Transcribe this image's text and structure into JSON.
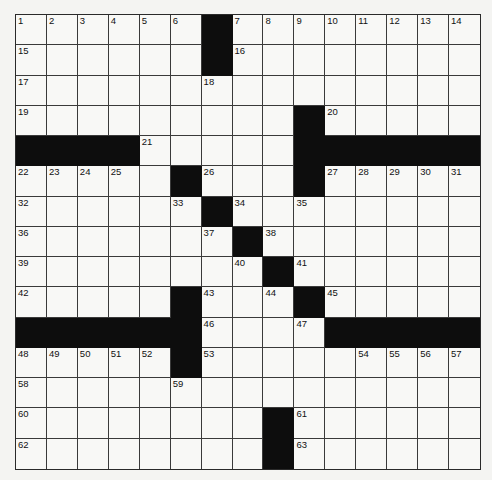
{
  "puzzle": {
    "rows": 15,
    "cols": 15,
    "colors": {
      "black": "#0d0d0d",
      "white": "#f8f8f6",
      "line": "#3a3a3a"
    },
    "layout": [
      "......#........",
      "......#........",
      "...............",
      ".........#.....",
      "####.....######",
      ".....#...#.....",
      "......#........",
      ".......#.......",
      "........#......",
      ".....#...#.....",
      "######....#####",
      ".....#.........",
      "...............",
      "........#......",
      "........#......"
    ],
    "numbers": [
      {
        "r": 0,
        "c": 0,
        "n": "1"
      },
      {
        "r": 0,
        "c": 1,
        "n": "2"
      },
      {
        "r": 0,
        "c": 2,
        "n": "3"
      },
      {
        "r": 0,
        "c": 3,
        "n": "4"
      },
      {
        "r": 0,
        "c": 4,
        "n": "5"
      },
      {
        "r": 0,
        "c": 5,
        "n": "6"
      },
      {
        "r": 0,
        "c": 7,
        "n": "7"
      },
      {
        "r": 0,
        "c": 8,
        "n": "8"
      },
      {
        "r": 0,
        "c": 9,
        "n": "9"
      },
      {
        "r": 0,
        "c": 10,
        "n": "10"
      },
      {
        "r": 0,
        "c": 11,
        "n": "11"
      },
      {
        "r": 0,
        "c": 12,
        "n": "12"
      },
      {
        "r": 0,
        "c": 13,
        "n": "13"
      },
      {
        "r": 0,
        "c": 14,
        "n": "14"
      },
      {
        "r": 1,
        "c": 0,
        "n": "15"
      },
      {
        "r": 1,
        "c": 7,
        "n": "16"
      },
      {
        "r": 2,
        "c": 0,
        "n": "17"
      },
      {
        "r": 2,
        "c": 6,
        "n": "18"
      },
      {
        "r": 3,
        "c": 0,
        "n": "19"
      },
      {
        "r": 3,
        "c": 10,
        "n": "20"
      },
      {
        "r": 4,
        "c": 4,
        "n": "21"
      },
      {
        "r": 5,
        "c": 0,
        "n": "22"
      },
      {
        "r": 5,
        "c": 1,
        "n": "23"
      },
      {
        "r": 5,
        "c": 2,
        "n": "24"
      },
      {
        "r": 5,
        "c": 3,
        "n": "25"
      },
      {
        "r": 5,
        "c": 6,
        "n": "26"
      },
      {
        "r": 5,
        "c": 10,
        "n": "27"
      },
      {
        "r": 5,
        "c": 11,
        "n": "28"
      },
      {
        "r": 5,
        "c": 12,
        "n": "29"
      },
      {
        "r": 5,
        "c": 13,
        "n": "30"
      },
      {
        "r": 5,
        "c": 14,
        "n": "31"
      },
      {
        "r": 6,
        "c": 0,
        "n": "32"
      },
      {
        "r": 6,
        "c": 5,
        "n": "33"
      },
      {
        "r": 6,
        "c": 7,
        "n": "34"
      },
      {
        "r": 6,
        "c": 9,
        "n": "35"
      },
      {
        "r": 7,
        "c": 0,
        "n": "36"
      },
      {
        "r": 7,
        "c": 6,
        "n": "37"
      },
      {
        "r": 7,
        "c": 8,
        "n": "38"
      },
      {
        "r": 8,
        "c": 0,
        "n": "39"
      },
      {
        "r": 8,
        "c": 7,
        "n": "40"
      },
      {
        "r": 8,
        "c": 9,
        "n": "41"
      },
      {
        "r": 9,
        "c": 0,
        "n": "42"
      },
      {
        "r": 9,
        "c": 6,
        "n": "43"
      },
      {
        "r": 9,
        "c": 8,
        "n": "44"
      },
      {
        "r": 9,
        "c": 10,
        "n": "45"
      },
      {
        "r": 10,
        "c": 6,
        "n": "46"
      },
      {
        "r": 10,
        "c": 9,
        "n": "47"
      },
      {
        "r": 11,
        "c": 0,
        "n": "48"
      },
      {
        "r": 11,
        "c": 1,
        "n": "49"
      },
      {
        "r": 11,
        "c": 2,
        "n": "50"
      },
      {
        "r": 11,
        "c": 3,
        "n": "51"
      },
      {
        "r": 11,
        "c": 4,
        "n": "52"
      },
      {
        "r": 11,
        "c": 6,
        "n": "53"
      },
      {
        "r": 11,
        "c": 11,
        "n": "54"
      },
      {
        "r": 11,
        "c": 12,
        "n": "55"
      },
      {
        "r": 11,
        "c": 13,
        "n": "56"
      },
      {
        "r": 11,
        "c": 14,
        "n": "57"
      },
      {
        "r": 12,
        "c": 0,
        "n": "58"
      },
      {
        "r": 12,
        "c": 5,
        "n": "59"
      },
      {
        "r": 13,
        "c": 0,
        "n": "60"
      },
      {
        "r": 13,
        "c": 9,
        "n": "61"
      },
      {
        "r": 14,
        "c": 0,
        "n": "62"
      },
      {
        "r": 14,
        "c": 9,
        "n": "63"
      }
    ]
  }
}
